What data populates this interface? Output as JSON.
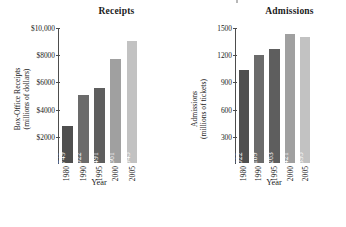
{
  "figure": {
    "background": "#ffffff",
    "axis_color": "#4d4d4d",
    "label_text_color": "#ffffff"
  },
  "panels": [
    {
      "key": "receipts",
      "title": "Receipts",
      "xtitle": "Year",
      "ytitle_line1": "Box-Office Receipts",
      "ytitle_line2": "(millions of dollars)"
    },
    {
      "key": "admissions",
      "title": "Admissions",
      "xtitle": "Year",
      "ytitle_line1": "Admissions",
      "ytitle_line2": "(millions of tickets)"
    }
  ],
  "chart_data": [
    {
      "type": "bar",
      "title": "Receipts",
      "xlabel": "Year",
      "ylabel": "Box-Office Receipts (millions of dollars)",
      "categories": [
        "1980",
        "1990",
        "1995",
        "2000",
        "2005"
      ],
      "values": [
        2749,
        5022,
        5491,
        7661,
        8945
      ],
      "value_labels": [
        "2749",
        "5022",
        "5491",
        "7661",
        "8945"
      ],
      "ylim": [
        0,
        10000
      ],
      "yticks": [
        2000,
        4000,
        6000,
        8000,
        10000
      ],
      "ytick_labels": [
        "$2000",
        "$4000",
        "$6000",
        "$8000",
        "$10,000"
      ],
      "grid": false,
      "legend": "none",
      "bar_colors": [
        "#4f4f4f",
        "#6b6b6b",
        "#5e5e5e",
        "#a0a0a0",
        "#c2c2c2"
      ]
    },
    {
      "type": "bar",
      "title": "Admissions",
      "xlabel": "Year",
      "ylabel": "Admissions (millions of tickets)",
      "categories": [
        "1980",
        "1990",
        "1995",
        "2000",
        "2005"
      ],
      "values": [
        1022,
        1189,
        1263,
        1421,
        1395
      ],
      "value_labels": [
        "1022",
        "1189",
        "1263",
        "1421",
        "1395"
      ],
      "ylim": [
        0,
        1500
      ],
      "yticks": [
        300,
        600,
        900,
        1200,
        1500
      ],
      "ytick_labels": [
        "300",
        "600",
        "900",
        "1200",
        "1500"
      ],
      "grid": false,
      "legend": "none",
      "bar_colors": [
        "#4f4f4f",
        "#6b6b6b",
        "#5e5e5e",
        "#a0a0a0",
        "#c2c2c2"
      ]
    }
  ]
}
